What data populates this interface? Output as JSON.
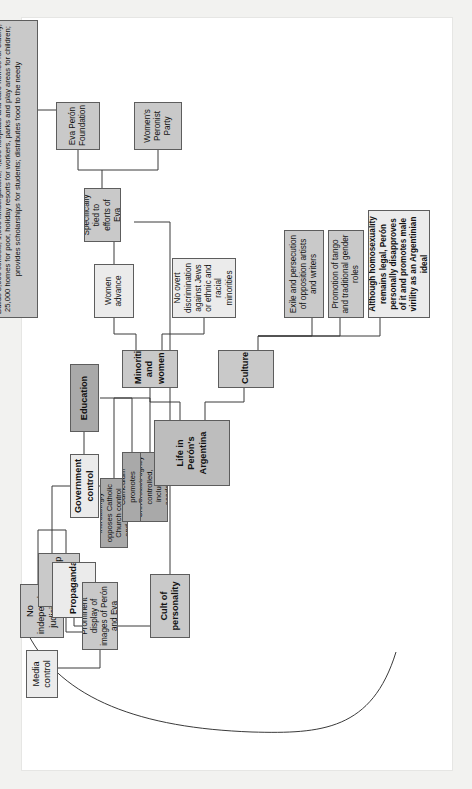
{
  "document": {
    "title": "Life in Perón's Argentina",
    "type": "concept map",
    "orientation": "rotated 90 degrees counter-clockwise"
  },
  "colors": {
    "page_frame": "#f2f2f0",
    "paper": "#ffffff",
    "node_light": "#ebebeb",
    "node_mid": "#c9c9c9",
    "node_dark": "#a9a9a9",
    "node_head": "#bdbdbd",
    "connector": "#3a3a3a",
    "text": "#111111"
  },
  "nodes": {
    "media_control": "Media control",
    "no_independent_judiciary": "No independent judiciary",
    "censorship": "Censorship",
    "propaganda": "Propaganda",
    "prominent_display": "Prominent display of images of Perón and Eva",
    "cult_of_personality": "Cult of personality",
    "government_control": "Government control",
    "education": "Education",
    "edu_church": "Increasingly opposes Catholic Church control and teachings",
    "edu_curriculum": "Curriculum promotes Peronism",
    "edu_universities": "Universities tightly controlled, including academics",
    "life_in_perons_argentina": "Life in Perón's Argentina",
    "minorities_and_women": "Minorities and women",
    "culture": "Culture",
    "women_advance": "Women advance",
    "no_overt_discrimination": "No overt discrimination against Jews or ethnic and racial minorities",
    "specifically_tied": "Specifically tied to efforts of Eva",
    "eva_peron_foundation": "Eva Perón Foundation",
    "womens_peronist_party": "Women's Peronist Party",
    "foundation_works": "Builds 8,000 schools, 1,000 kindergartens, 4,200 hospitals and care homes for elderly, 25,000 homes for poor, holiday resorts for workers, parks and play areas for children; provides scholarships for students; distributes food to the needy",
    "exile_persecution": "Exile and persecution of opposition artists and writers",
    "promotion_tango": "Promotion of tango and traditional gender roles",
    "homosexuality": "Although homosexuality remains legal, Perón personally disapproves of it and promotes male virility as an Argentinian ideal"
  },
  "edges": [
    {
      "from": "life_in_perons_argentina",
      "to": "government_control"
    },
    {
      "from": "life_in_perons_argentina",
      "to": "minorities_and_women"
    },
    {
      "from": "life_in_perons_argentina",
      "to": "culture"
    },
    {
      "from": "government_control",
      "to": "censorship"
    },
    {
      "from": "government_control",
      "to": "no_independent_judiciary"
    },
    {
      "from": "government_control",
      "to": "propaganda"
    },
    {
      "from": "government_control",
      "to": "education"
    },
    {
      "from": "censorship",
      "to": "media_control"
    },
    {
      "from": "media_control",
      "to": "prominent_display"
    },
    {
      "from": "media_control",
      "to": "exile_persecution"
    },
    {
      "from": "propaganda",
      "to": "prominent_display"
    },
    {
      "from": "propaganda",
      "to": "cult_of_personality"
    },
    {
      "from": "cult_of_personality",
      "to": "specifically_tied"
    },
    {
      "from": "education",
      "to": "edu_church"
    },
    {
      "from": "education",
      "to": "edu_curriculum"
    },
    {
      "from": "education",
      "to": "edu_universities"
    },
    {
      "from": "minorities_and_women",
      "to": "women_advance"
    },
    {
      "from": "minorities_and_women",
      "to": "no_overt_discrimination"
    },
    {
      "from": "women_advance",
      "to": "specifically_tied"
    },
    {
      "from": "specifically_tied",
      "to": "eva_peron_foundation"
    },
    {
      "from": "specifically_tied",
      "to": "womens_peronist_party"
    },
    {
      "from": "eva_peron_foundation",
      "to": "foundation_works"
    },
    {
      "from": "culture",
      "to": "exile_persecution"
    },
    {
      "from": "culture",
      "to": "promotion_tango"
    },
    {
      "from": "culture",
      "to": "homosexuality"
    }
  ]
}
